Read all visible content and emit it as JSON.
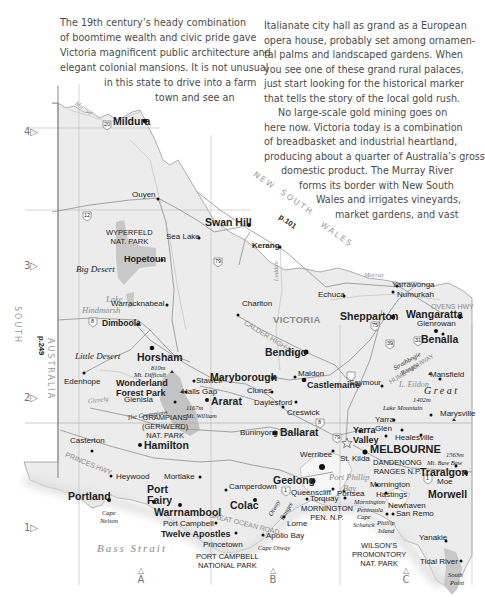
{
  "article": {
    "left_column": [
      "The 19th century’s heady combination",
      "of boomtime wealth and civic pride gave",
      "Victoria magnificent public architecture and",
      "elegant colonial mansions. It is not unusual",
      "in this state to drive into a farm",
      "town and see an"
    ],
    "right_column": [
      "Italianate city hall as grand as a European",
      "opera house, probably set among ornamen-",
      "tal palms and landscaped gardens. When",
      "you see one of these grand rural palaces,",
      "just start looking for the historical marker",
      "that tells the story of the local gold rush.",
      "No large-scale gold mining goes on",
      "here now. Victoria today is a combination",
      "of breadbasket and industrial heartland,",
      "producing about a quarter of Australia’s gross",
      "domestic product. The Murray River",
      "forms its border with New South",
      "Wales and irrigates vineyards,",
      "market gardens, and vast"
    ]
  },
  "map": {
    "state_label": "VICTORIA",
    "neighbor_states": {
      "nsw": [
        "NEW",
        "SOUTH",
        "WALES"
      ],
      "nsw_page_ref": "p.101",
      "sa": [
        "SOUTH",
        "AUSTRALIA"
      ],
      "sa_page_ref": "p.249"
    },
    "row_labels": [
      "4▷",
      "3▷",
      "2▷",
      "1▷"
    ],
    "col_labels": [
      "A",
      "B",
      "C"
    ],
    "water": {
      "strait": "Bass Strait",
      "bay": [
        "Port Phillip",
        "Bay"
      ],
      "lake_hindmarsh": [
        "Lake",
        "Hindmarsh"
      ],
      "lake_eildon": "L. Eildon",
      "murray": "Murray",
      "glenelg": "Glenelg",
      "loddon": "Loddon",
      "lake_corangamite": [
        "Lake",
        "Corangamite"
      ]
    },
    "regions": {
      "big_desert": "Big Desert",
      "little_desert": "Little Desert",
      "great": "Great",
      "strathbogie": [
        "Strathbogie",
        "Ranges"
      ],
      "otway": [
        "Otway",
        "Ranges"
      ],
      "the_grampians": "The Grampians",
      "mornington_peninsula": [
        "Mornington",
        "Peninsula"
      ],
      "phillip_island": [
        "Phillip",
        "Island"
      ],
      "cape_nelson": [
        "Cape",
        "Nelson"
      ],
      "cape_otway": "Cape Otway",
      "cape_schanck": [
        "Cape",
        "Schanck"
      ],
      "south_point": [
        "South",
        "Point"
      ]
    },
    "roads": {
      "calder": "CALDER HIGHWAY",
      "princes": "PRINCES HWY",
      "great_ocean": "GREAT OCEAN ROAD",
      "ovens": "OVENS HWY",
      "hume": "HUME HIGHWAY",
      "shields": [
        "20",
        "12",
        "79",
        "8",
        "75",
        "39",
        "31",
        "8",
        "79",
        "1",
        "1"
      ]
    },
    "parks": {
      "wyperfeld": [
        "WYPERFELD",
        "NAT. PARK"
      ],
      "grampians": [
        "GRAMPIANS",
        "(GERIWERD)",
        "NAT. PARK"
      ],
      "port_campbell": [
        "PORT CAMPBELL",
        "NATIONAL PARK"
      ],
      "mornington": [
        "MORNINGTON",
        "PEN. N.P."
      ],
      "dandenong": [
        "DANDENONG",
        "RANGES N.P."
      ],
      "wilsons": [
        "WILSON’S",
        "PROMONTORY",
        "NAT. PARK"
      ],
      "wonderland": [
        "Wonderland",
        "Forest Park"
      ]
    },
    "peaks": {
      "mt_difficult": [
        "810m",
        "Mt. Difficult"
      ],
      "mt_william": [
        "1167m",
        "Mt. William"
      ],
      "lake_mountain": [
        "1402m",
        "Lake Mountain"
      ],
      "mt_baw_baw": [
        "1563m",
        "Mt. Baw Baw"
      ]
    },
    "cities": {
      "mildura": "Mildura",
      "ouyen": "Ouyen",
      "swan_hill": "Swan Hill",
      "sea_lake": "Sea Lake",
      "hopetoun": "Hopetoun",
      "kerang": "Kerang",
      "warracknabeal": "Warracknabeal",
      "dimboola": "Dimboola",
      "charlton": "Charlton",
      "echuca": "Echuca",
      "yarrawonga": "Yarrawonga",
      "numurkah": "Numurkah",
      "shepparton": "Shepparton",
      "wangaratta": "Wangaratta",
      "glenrowan": "Glenrowan",
      "benalla": "Benalla",
      "horsham": "Horsham",
      "bendigo": "Bendigo",
      "maryborough": "Maryborough",
      "maldon": "Maldon",
      "castlemaine": "Castlemaine",
      "seymour": "Seymour",
      "mansfield": "Mansfield",
      "edenhope": "Edenhope",
      "stawell": "Stawell",
      "halls_gap": "Halls Gap",
      "glenisla": "Glenisla",
      "ararat": "Ararat",
      "clunes": "Clunes",
      "daylesford": "Daylesford",
      "creswick": "Creswick",
      "marysville": "Marysville",
      "ballarat": "Ballarat",
      "yarra_glen": [
        "Yarra",
        "Glen"
      ],
      "healesville": "Healesville",
      "yarra_valley": [
        "Yarra",
        "Valley"
      ],
      "melbourne": "MELBOURNE",
      "casterton": "Casterton",
      "hamilton": "Hamilton",
      "buninyong": "Buninyong",
      "werribee": "Werribee",
      "st_kilda": "St. Kilda",
      "traralgon": "Traralgon",
      "moe": "Moe",
      "heywood": "Heywood",
      "mortlake": "Mortlake",
      "camperdown": "Camperdown",
      "geelong": "Geelong",
      "queenscliff": "Queenscliff",
      "portsea": "Portsea",
      "mornington": "Mornington",
      "hastings": "Hastings",
      "morwell": "Morwell",
      "portland": "Portland",
      "port_fairy": [
        "Port",
        "Fairy"
      ],
      "warrnambool": "Warrnambool",
      "colac": "Colac",
      "torquay": "Torquay",
      "newhaven": "Newhaven",
      "san_remo": "San Remo",
      "port_campbell": "Port Campbell",
      "twelve_apostles": "Twelve Apostles",
      "lorne": "Lorne",
      "princetown": "Princetown",
      "apollo_bay": "Apollo Bay",
      "yanakie": "Yanakie",
      "tidal_river": "Tidal River"
    }
  }
}
